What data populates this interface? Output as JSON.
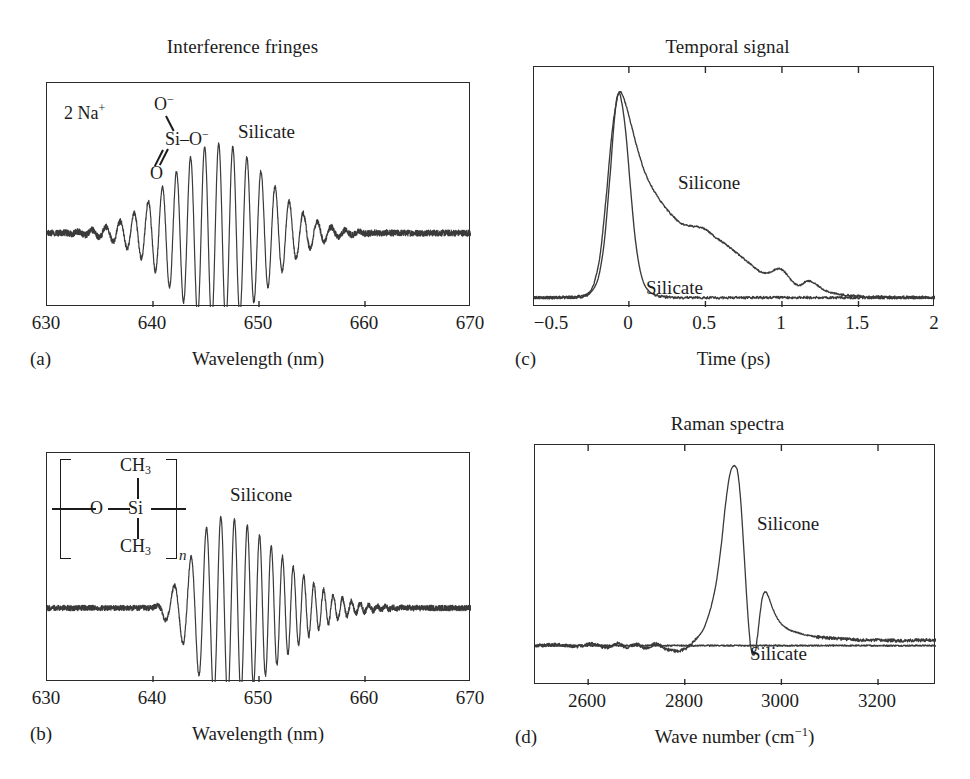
{
  "figure": {
    "panels": [
      "a",
      "b",
      "c",
      "d"
    ]
  },
  "panel_a": {
    "label": "(a)",
    "title": "Interference fringes",
    "xlabel": "Wavelength (nm)",
    "curve_label": "Silicate",
    "chem": {
      "counterion": "2 Na",
      "counterion_charge": "+",
      "o_top": "O",
      "o_top_charge": "−",
      "si": "Si",
      "o_right": "O",
      "o_right_charge": "−",
      "o_bottom": "O",
      "bond_dash": "–"
    }
  },
  "panel_b": {
    "label": "(b)",
    "title": "",
    "xlabel": "Wavelength (nm)",
    "curve_label": "Silicone",
    "chem": {
      "ch3_top": "CH",
      "ch3_top_sub": "3",
      "o": "O",
      "si": "Si",
      "ch3_bottom": "CH",
      "ch3_bottom_sub": "3",
      "repeat": "n"
    }
  },
  "panel_c": {
    "label": "(c)",
    "title": "Temporal signal",
    "xlabel": "Time (ps)",
    "curve_label_1": "Silicone",
    "curve_label_2": "Silicate"
  },
  "panel_d": {
    "label": "(d)",
    "title": "Raman spectra",
    "xlabel_html": "Wave number (cm⁻¹)",
    "xlabel": "Wave number (cm-1)",
    "curve_label_1": "Silicone",
    "curve_label_2": "Silicate"
  },
  "colors": {
    "ink": "#1c1c1c",
    "frame": "#2b2b2b",
    "curve": "#3a3a3a",
    "background": "#ffffff"
  },
  "chart_data": [
    {
      "id": "a",
      "type": "line",
      "title": "Interference fringes",
      "xlabel": "Wavelength (nm)",
      "ylabel": "",
      "xlim": [
        630,
        670
      ],
      "ylim": [
        -1.15,
        1.15
      ],
      "xticks": [
        630,
        640,
        650,
        660,
        670
      ],
      "xticklabels": [
        "630",
        "640",
        "650",
        "660",
        "670"
      ],
      "interior_ticks": [
        640,
        650,
        660
      ],
      "grid": false,
      "legend": "inline-annotation",
      "annotations": [
        {
          "text": "Silicate",
          "x": 653.2,
          "y": 0.82
        },
        {
          "text": "2 Na+ silicate anion structure",
          "x": 635.5,
          "y": 0.93
        }
      ],
      "series": [
        {
          "name": "Silicate",
          "model": "gaussian-enveloped-fringes",
          "center_nm": 646.2,
          "envelope_sigma_nm": 4.6,
          "fringe_period_nm": 1.33,
          "peak_amplitude": 1.0,
          "baseline": 0.0,
          "symmetric": true,
          "chirp": 0.0,
          "noise_amplitude": 0.035
        }
      ]
    },
    {
      "id": "b",
      "type": "line",
      "title": "",
      "xlabel": "Wavelength (nm)",
      "ylabel": "",
      "xlim": [
        630,
        670
      ],
      "ylim": [
        -1.15,
        1.15
      ],
      "xticks": [
        630,
        640,
        650,
        660,
        670
      ],
      "xticklabels": [
        "630",
        "640",
        "650",
        "660",
        "670"
      ],
      "interior_ticks": [
        640,
        650,
        660
      ],
      "grid": false,
      "legend": "inline-annotation",
      "annotations": [
        {
          "text": "Silicone",
          "x": 652.0,
          "y": 0.84
        },
        {
          "text": "silicone repeat-unit structure",
          "x": 634.5,
          "y": 0.9
        }
      ],
      "series": [
        {
          "name": "Silicone",
          "model": "asymmetric-chirped-fringes",
          "center_nm": 646.4,
          "rise_sigma_nm": 2.6,
          "decay_sigma_nm": 5.4,
          "fringe_period_nm": 1.32,
          "chirp": 0.22,
          "peak_amplitude": 1.0,
          "baseline": 0.0,
          "symmetric": false,
          "noise_amplitude": 0.03
        }
      ]
    },
    {
      "id": "c",
      "type": "line",
      "title": "Temporal signal",
      "xlabel": "Time (ps)",
      "ylabel": "",
      "xlim": [
        -0.62,
        2.0
      ],
      "ylim": [
        -0.04,
        1.12
      ],
      "xticks": [
        -0.5,
        0,
        0.5,
        1,
        1.5,
        2
      ],
      "xticklabels": [
        "−0.5",
        "0",
        "0.5",
        "1",
        "1.5",
        "2"
      ],
      "interior_ticks": [
        0,
        0.5,
        1,
        1.5
      ],
      "grid": false,
      "legend": "inline-annotation",
      "annotations": [
        {
          "text": "Silicone",
          "x": 0.42,
          "y": 0.42
        },
        {
          "text": "Silicate",
          "x": 0.2,
          "y": 0.1
        }
      ],
      "series": [
        {
          "name": "Silicate",
          "comment": "narrow instrument-limited pulse",
          "x": [
            -0.62,
            -0.4,
            -0.3,
            -0.25,
            -0.2,
            -0.16,
            -0.12,
            -0.09,
            -0.07,
            -0.05,
            -0.02,
            0.01,
            0.04,
            0.07,
            0.1,
            0.14,
            0.2,
            0.3,
            0.5,
            0.8,
            1.1,
            1.5,
            2.0
          ],
          "y": [
            0.005,
            0.006,
            0.01,
            0.03,
            0.1,
            0.28,
            0.62,
            0.9,
            0.99,
            0.96,
            0.8,
            0.54,
            0.3,
            0.15,
            0.07,
            0.03,
            0.012,
            0.006,
            0.005,
            0.005,
            0.006,
            0.005,
            0.005
          ]
        },
        {
          "name": "Silicone",
          "comment": "same rise, long non-exponential decay with shoulder at 0.35 and bumps at 0.93 and 1.15",
          "x": [
            -0.62,
            -0.4,
            -0.3,
            -0.24,
            -0.19,
            -0.15,
            -0.11,
            -0.08,
            -0.06,
            -0.03,
            0.0,
            0.05,
            0.1,
            0.15,
            0.2,
            0.25,
            0.3,
            0.34,
            0.38,
            0.42,
            0.46,
            0.5,
            0.56,
            0.62,
            0.68,
            0.74,
            0.8,
            0.85,
            0.88,
            0.91,
            0.94,
            0.97,
            1.0,
            1.04,
            1.08,
            1.12,
            1.15,
            1.18,
            1.22,
            1.27,
            1.33,
            1.4,
            1.5,
            1.65,
            1.8,
            2.0
          ],
          "y": [
            0.005,
            0.007,
            0.015,
            0.05,
            0.2,
            0.48,
            0.8,
            0.95,
            1.0,
            0.96,
            0.88,
            0.74,
            0.62,
            0.54,
            0.48,
            0.43,
            0.39,
            0.365,
            0.355,
            0.35,
            0.345,
            0.335,
            0.3,
            0.27,
            0.235,
            0.2,
            0.165,
            0.135,
            0.125,
            0.125,
            0.135,
            0.145,
            0.14,
            0.11,
            0.075,
            0.065,
            0.08,
            0.085,
            0.07,
            0.045,
            0.028,
            0.018,
            0.012,
            0.009,
            0.008,
            0.007
          ]
        }
      ]
    },
    {
      "id": "d",
      "type": "line",
      "title": "Raman spectra",
      "xlabel": "Wave number (cm-1)",
      "ylabel": "",
      "xlim": [
        2490,
        3320
      ],
      "ylim": [
        -0.22,
        1.12
      ],
      "xticks": [
        2600,
        2800,
        3000,
        3200
      ],
      "xticklabels": [
        "2600",
        "2800",
        "3000",
        "3200"
      ],
      "interior_ticks": [
        2600,
        2800,
        3000,
        3200
      ],
      "grid": false,
      "legend": "inline-annotation",
      "annotations": [
        {
          "text": "Silicone",
          "x": 3010,
          "y": 0.62
        },
        {
          "text": "Silicate",
          "x": 3000,
          "y": -0.14
        }
      ],
      "series": [
        {
          "name": "Silicone",
          "comment": "C-H stretch: strong peak 2905 cm-1, shoulder/secondary peak 2965 cm-1, dip between",
          "peaks": [
            {
              "center": 2905,
              "height": 1.0,
              "width": 35
            },
            {
              "center": 2963,
              "height": 0.3,
              "width": 18
            }
          ],
          "x": [
            2490,
            2540,
            2580,
            2610,
            2640,
            2660,
            2680,
            2700,
            2720,
            2740,
            2760,
            2780,
            2795,
            2810,
            2825,
            2840,
            2855,
            2865,
            2875,
            2885,
            2893,
            2900,
            2905,
            2910,
            2916,
            2922,
            2928,
            2934,
            2938,
            2942,
            2946,
            2950,
            2955,
            2960,
            2966,
            2972,
            2980,
            2990,
            3000,
            3015,
            3030,
            3050,
            3070,
            3090,
            3110,
            3140,
            3170,
            3200,
            3240,
            3280,
            3320
          ],
          "y": [
            0.0,
            0.005,
            -0.005,
            0.01,
            -0.012,
            0.012,
            -0.01,
            0.008,
            -0.015,
            0.01,
            -0.018,
            -0.03,
            -0.025,
            0.0,
            0.04,
            0.1,
            0.22,
            0.35,
            0.55,
            0.8,
            0.95,
            1.0,
            1.0,
            0.96,
            0.8,
            0.55,
            0.28,
            0.06,
            -0.03,
            -0.05,
            -0.03,
            0.04,
            0.16,
            0.26,
            0.3,
            0.28,
            0.22,
            0.16,
            0.12,
            0.09,
            0.075,
            0.06,
            0.05,
            0.045,
            0.04,
            0.035,
            0.03,
            0.03,
            0.028,
            0.03,
            0.03
          ]
        },
        {
          "name": "Silicate",
          "comment": "featureless flat baseline",
          "x": [
            2490,
            2600,
            2700,
            2800,
            2900,
            3000,
            3100,
            3200,
            3320
          ],
          "y": [
            0.0,
            0.0,
            0.0,
            0.0,
            0.0,
            0.0,
            0.0,
            0.0,
            0.0
          ]
        }
      ]
    }
  ]
}
